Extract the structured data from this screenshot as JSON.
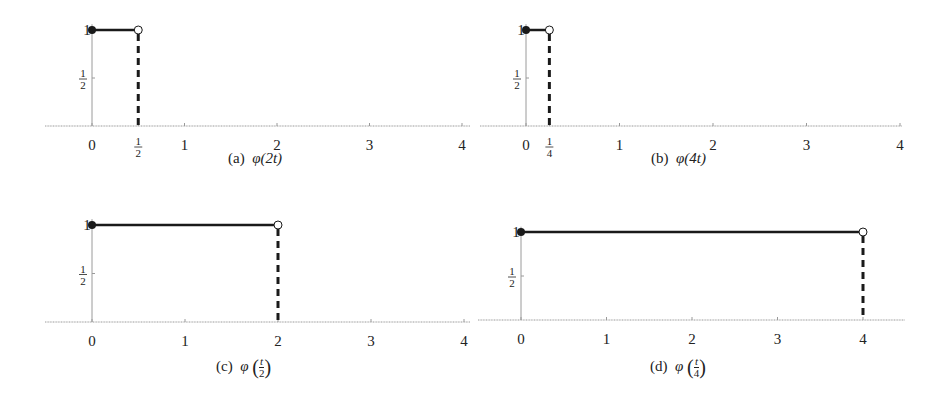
{
  "chart_data": [
    {
      "id": "a",
      "type": "line",
      "title": "(a) φ(2t)",
      "caption_label": "(a)",
      "caption_func": "φ(2t)",
      "xlabel": "",
      "ylabel": "",
      "xlim": [
        -0.5,
        4.05
      ],
      "ylim": [
        0,
        1
      ],
      "x_ticks": [
        0,
        0.5,
        1,
        2,
        3,
        4
      ],
      "x_tick_labels": [
        "0",
        "1/2",
        "1",
        "2",
        "3",
        "4"
      ],
      "y_ticks": [
        0.5,
        1
      ],
      "y_tick_labels": [
        "1/2",
        "1"
      ],
      "segments": [
        {
          "x0": 0,
          "x1": 0.5,
          "y": 1
        }
      ],
      "closed_points": [
        [
          0,
          1
        ]
      ],
      "open_points": [
        [
          0.5,
          1
        ]
      ],
      "dashed_drops": [
        {
          "x": 0.5,
          "y_from": 1,
          "y_to": 0
        }
      ],
      "grid": false
    },
    {
      "id": "b",
      "type": "line",
      "title": "(b) φ(4t)",
      "caption_label": "(b)",
      "caption_func": "φ(4t)",
      "xlabel": "",
      "ylabel": "",
      "xlim": [
        -0.5,
        4.05
      ],
      "ylim": [
        0,
        1
      ],
      "x_ticks": [
        0,
        0.25,
        1,
        2,
        3,
        4
      ],
      "x_tick_labels": [
        "0",
        "1/4",
        "1",
        "2",
        "3",
        "4"
      ],
      "y_ticks": [
        0.5,
        1
      ],
      "y_tick_labels": [
        "1/2",
        "1"
      ],
      "segments": [
        {
          "x0": 0,
          "x1": 0.25,
          "y": 1
        }
      ],
      "closed_points": [
        [
          0,
          1
        ]
      ],
      "open_points": [
        [
          0.25,
          1
        ]
      ],
      "dashed_drops": [
        {
          "x": 0.25,
          "y_from": 1,
          "y_to": 0
        }
      ],
      "grid": false
    },
    {
      "id": "c",
      "type": "line",
      "title": "(c) φ(t/2)",
      "caption_label": "(c)",
      "caption_func": "φ",
      "caption_frac": {
        "num": "t",
        "den": "2"
      },
      "xlabel": "",
      "ylabel": "",
      "xlim": [
        -0.5,
        4.05
      ],
      "ylim": [
        0,
        1
      ],
      "x_ticks": [
        0,
        1,
        2,
        3,
        4
      ],
      "x_tick_labels": [
        "0",
        "1",
        "2",
        "3",
        "4"
      ],
      "y_ticks": [
        0.5,
        1
      ],
      "y_tick_labels": [
        "1/2",
        "1"
      ],
      "segments": [
        {
          "x0": 0,
          "x1": 2,
          "y": 1
        }
      ],
      "closed_points": [
        [
          0,
          1
        ]
      ],
      "open_points": [
        [
          2,
          1
        ]
      ],
      "dashed_drops": [
        {
          "x": 2,
          "y_from": 1,
          "y_to": 0
        }
      ],
      "grid": false
    },
    {
      "id": "d",
      "type": "line",
      "title": "(d) φ(t/4)",
      "caption_label": "(d)",
      "caption_func": "φ",
      "caption_frac": {
        "num": "t",
        "den": "4"
      },
      "xlabel": "",
      "ylabel": "",
      "xlim": [
        -0.5,
        4.5
      ],
      "ylim": [
        0,
        1
      ],
      "x_ticks": [
        0,
        1,
        2,
        3,
        4
      ],
      "x_tick_labels": [
        "0",
        "1",
        "2",
        "3",
        "4"
      ],
      "y_ticks": [
        0.5,
        1
      ],
      "y_tick_labels": [
        "1/2",
        "1"
      ],
      "segments": [
        {
          "x0": 0,
          "x1": 4,
          "y": 1
        }
      ],
      "closed_points": [
        [
          0,
          1
        ]
      ],
      "open_points": [
        [
          4,
          1
        ]
      ],
      "dashed_drops": [
        {
          "x": 4,
          "y_from": 1,
          "y_to": 0
        }
      ],
      "grid": false
    }
  ],
  "captions": {
    "a": {
      "label": "(a)",
      "func": "φ(2t)"
    },
    "b": {
      "label": "(b)",
      "func": "φ(4t)"
    },
    "c": {
      "label": "(c)",
      "func": "φ",
      "num": "t",
      "den": "2"
    },
    "d": {
      "label": "(d)",
      "func": "φ",
      "num": "t",
      "den": "4"
    }
  },
  "colors": {
    "axis": "#9a9a9a",
    "line": "#1a1a1a",
    "text": "#222222"
  }
}
